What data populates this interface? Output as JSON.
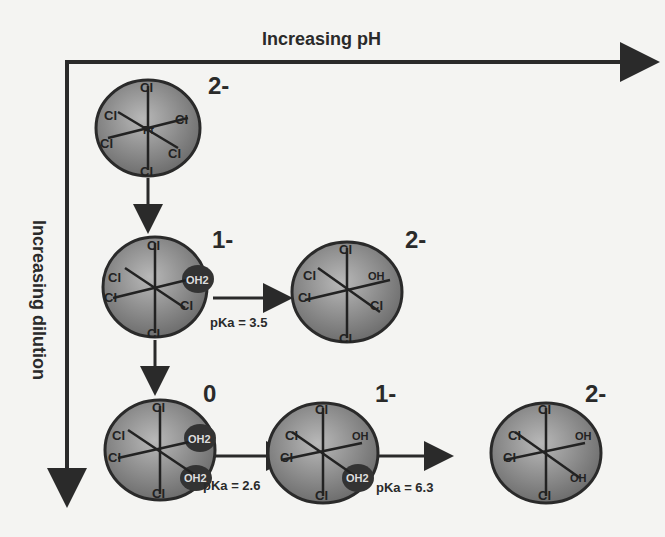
{
  "axes": {
    "x_label": "Increasing pH",
    "y_label": "Increasing dilution"
  },
  "species": [
    {
      "id": "PtCl6",
      "charge": "2-",
      "ligands": [
        "Cl",
        "Cl",
        "Cl",
        "Cl",
        "Cl",
        "Cl"
      ],
      "row": 0,
      "col": 0
    },
    {
      "id": "PtCl5(H2O)",
      "charge": "1-",
      "ligands": [
        "Cl",
        "Cl",
        "Cl",
        "Cl",
        "Cl",
        "OH2"
      ],
      "row": 1,
      "col": 0
    },
    {
      "id": "PtCl5(OH)",
      "charge": "2-",
      "ligands": [
        "Cl",
        "Cl",
        "Cl",
        "Cl",
        "Cl",
        "OH"
      ],
      "row": 1,
      "col": 1
    },
    {
      "id": "PtCl4(H2O)2",
      "charge": "0",
      "ligands": [
        "Cl",
        "Cl",
        "Cl",
        "Cl",
        "OH2",
        "OH2"
      ],
      "row": 2,
      "col": 0
    },
    {
      "id": "PtCl4(OH)(H2O)",
      "charge": "1-",
      "ligands": [
        "Cl",
        "Cl",
        "Cl",
        "Cl",
        "OH",
        "OH2"
      ],
      "row": 2,
      "col": 1
    },
    {
      "id": "PtCl4(OH)2",
      "charge": "2-",
      "ligands": [
        "Cl",
        "Cl",
        "Cl",
        "Cl",
        "OH",
        "OH"
      ],
      "row": 2,
      "col": 2
    }
  ],
  "transitions": [
    {
      "from": "PtCl5(H2O)",
      "to": "PtCl5(OH)",
      "label": "pKa = 3.5"
    },
    {
      "from": "PtCl4(H2O)2",
      "to": "PtCl4(OH)(H2O)",
      "label": "pKa = 2.6"
    },
    {
      "from": "PtCl4(OH)(H2O)",
      "to": "PtCl4(OH)2",
      "label": "pKa = 6.3"
    }
  ],
  "atoms": {
    "center": "Pt",
    "chloride": "Cl",
    "aqua": "OH2",
    "hydroxo": "OH"
  },
  "colors": {
    "line": "#2a2a2a",
    "sphere": "#8c8c8c",
    "background": "#f4f4f2"
  }
}
